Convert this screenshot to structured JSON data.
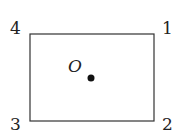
{
  "diagram": {
    "corners": {
      "c1": "1",
      "c2": "2",
      "c3": "3",
      "c4": "4"
    },
    "center_label": "O",
    "colors": {
      "stroke": "#333333",
      "dot": "#111111"
    }
  }
}
